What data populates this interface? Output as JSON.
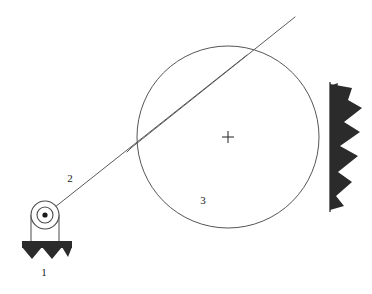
{
  "figure": {
    "type": "mechanics-free-body-diagram",
    "background_color": "#ffffff",
    "line_color": "#4a4a4a",
    "hatch_color": "#2b2b2b",
    "width": 372,
    "height": 294
  },
  "labels": {
    "pulley": "1",
    "cable": "2",
    "drum": "3"
  },
  "components": {
    "pulley": {
      "name": "pulley-assembly",
      "center_x": 45,
      "center_y": 215,
      "outer_radius": 14,
      "middle_radius": 8,
      "hub_radius": 2.6,
      "label": "1"
    },
    "ground_support": {
      "name": "hatched-ground-base",
      "x": 22,
      "y": 241,
      "width": 50,
      "band_height": 7,
      "teeth": 5,
      "tooth_depth": 10
    },
    "cable": {
      "name": "cable-segment",
      "from_x": 45,
      "from_y": 215,
      "to_x": 295,
      "to_y": 17,
      "label": "2",
      "double_line_gap": 3
    },
    "drum": {
      "name": "drum-circle",
      "center_x": 228,
      "center_y": 137,
      "radius": 91,
      "label": "3",
      "center_mark": "plus"
    },
    "wall": {
      "name": "fixed-wall",
      "line_x": 330,
      "top_y": 82,
      "bottom_y": 212,
      "hatch_extent": 35
    }
  },
  "annotations": {
    "center_mark_x": 228,
    "center_mark_y": 137,
    "label_1_x": 44,
    "label_1_y": 272,
    "label_2_x": 70,
    "label_2_y": 178,
    "label_3_x": 203,
    "label_3_y": 200
  }
}
